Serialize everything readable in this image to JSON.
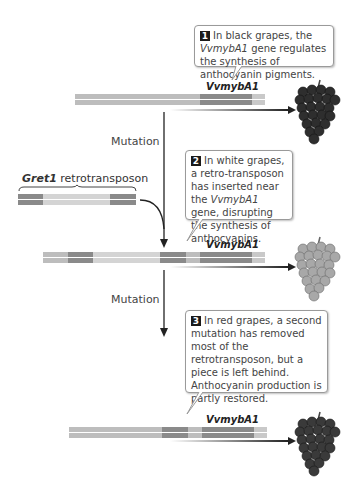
{
  "steps": [
    {
      "number": "1",
      "text_parts": [
        "In black grapes, the ",
        "VvmybA1",
        " gene regulates the synthesis of anthocyanin pigments."
      ]
    },
    {
      "number": "2",
      "text_parts": [
        "In white grapes, a retro-transposon has inserted near the ",
        "VvmybA1",
        " gene, disrupting the synthesis of anthocyanins."
      ]
    },
    {
      "number": "3",
      "text": "In red grapes, a second mutation has removed most of the retrotransposon, but a piece is left behind. Anthocyanin production is partly restored."
    }
  ],
  "gene_label": "VvmybA1",
  "retrotransposon_label": {
    "name": "Gret1",
    "suffix": " retrotransposon"
  },
  "mutation_labels": [
    "Mutation",
    "Mutation"
  ],
  "grapes": [
    {
      "type": "black",
      "color": "#2e2e2e"
    },
    {
      "type": "white",
      "color": "#9a9a9a"
    },
    {
      "type": "red",
      "color": "#3a3a3a"
    }
  ],
  "colors": {
    "dna_light": "#bdbdbd",
    "dna_dark": "#8a8a8a",
    "callout_border": "#9a9a9a",
    "step_badge": "#1a1a1a"
  }
}
